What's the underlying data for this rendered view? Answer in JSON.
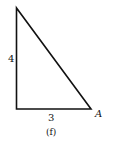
{
  "figure": {
    "caption": "(f)",
    "shape": "right-triangle",
    "side_labels": {
      "vertical": "4",
      "horizontal": "3"
    },
    "vertex_labels": {
      "bottom_right": "A"
    },
    "stroke_color": "#111111",
    "background": "#ffffff"
  }
}
